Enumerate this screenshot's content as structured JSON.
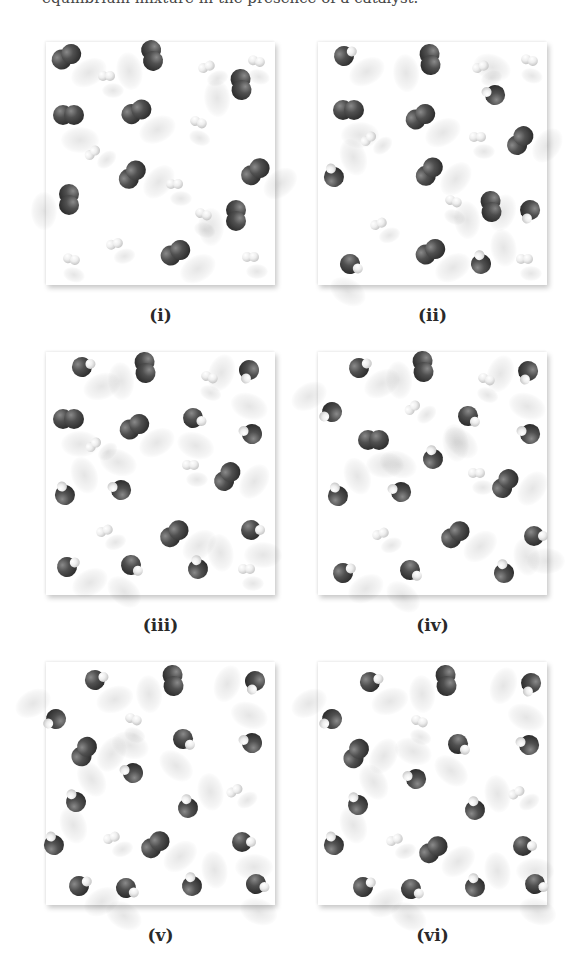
{
  "caption_top": "equilibrium mixture in the presence of a catalyst.",
  "legend": {
    "I": {
      "name": "iodine atom",
      "color": "#3a3a3a"
    },
    "H": {
      "name": "hydrogen atom",
      "color": "#e8e8e8"
    }
  },
  "panels": [
    {
      "label": "(i)",
      "counts": {
        "I2": 10,
        "H2": 10,
        "HI": 0
      },
      "molecules": [
        {
          "t": "I2",
          "x": 20,
          "y": 15,
          "a": -30
        },
        {
          "t": "I2",
          "x": 106,
          "y": 13,
          "a": 80
        },
        {
          "t": "I2",
          "x": 195,
          "y": 42,
          "a": 85
        },
        {
          "t": "I2",
          "x": 22,
          "y": 73,
          "a": 0
        },
        {
          "t": "I2",
          "x": 90,
          "y": 70,
          "a": -25
        },
        {
          "t": "I2",
          "x": 86,
          "y": 133,
          "a": -50
        },
        {
          "t": "I2",
          "x": 23,
          "y": 157,
          "a": 90
        },
        {
          "t": "I2",
          "x": 209,
          "y": 130,
          "a": -40
        },
        {
          "t": "I2",
          "x": 190,
          "y": 173,
          "a": 90
        },
        {
          "t": "I2",
          "x": 129,
          "y": 211,
          "a": -30
        },
        {
          "t": "H2",
          "x": 60,
          "y": 34,
          "a": 0
        },
        {
          "t": "H2",
          "x": 160,
          "y": 25,
          "a": -20
        },
        {
          "t": "H2",
          "x": 210,
          "y": 19,
          "a": 15
        },
        {
          "t": "H2",
          "x": 152,
          "y": 80,
          "a": 20
        },
        {
          "t": "H2",
          "x": 46,
          "y": 111,
          "a": -40
        },
        {
          "t": "H2",
          "x": 128,
          "y": 142,
          "a": 0
        },
        {
          "t": "H2",
          "x": 157,
          "y": 172,
          "a": 20
        },
        {
          "t": "H2",
          "x": 68,
          "y": 202,
          "a": -15
        },
        {
          "t": "H2",
          "x": 25,
          "y": 217,
          "a": 15
        },
        {
          "t": "H2",
          "x": 204,
          "y": 215,
          "a": 0
        }
      ]
    },
    {
      "label": "(ii)",
      "counts": {
        "I2": 7,
        "H2": 7,
        "HI": 6
      },
      "molecules": [
        {
          "t": "I2",
          "x": 112,
          "y": 17,
          "a": 85
        },
        {
          "t": "I2",
          "x": 30,
          "y": 68,
          "a": 0
        },
        {
          "t": "I2",
          "x": 102,
          "y": 75,
          "a": -30
        },
        {
          "t": "I2",
          "x": 202,
          "y": 99,
          "a": -55
        },
        {
          "t": "I2",
          "x": 111,
          "y": 130,
          "a": -50
        },
        {
          "t": "I2",
          "x": 173,
          "y": 164,
          "a": 85
        },
        {
          "t": "I2",
          "x": 112,
          "y": 210,
          "a": -30
        },
        {
          "t": "HI",
          "x": 26,
          "y": 14,
          "a": -30
        },
        {
          "t": "HI",
          "x": 177,
          "y": 53,
          "a": 200
        },
        {
          "t": "HI",
          "x": 16,
          "y": 135,
          "a": -110
        },
        {
          "t": "HI",
          "x": 212,
          "y": 168,
          "a": 110
        },
        {
          "t": "HI",
          "x": 32,
          "y": 222,
          "a": 30
        },
        {
          "t": "HI",
          "x": 163,
          "y": 222,
          "a": -100
        },
        {
          "t": "H2",
          "x": 162,
          "y": 25,
          "a": -20
        },
        {
          "t": "H2",
          "x": 211,
          "y": 18,
          "a": 15
        },
        {
          "t": "H2",
          "x": 50,
          "y": 97,
          "a": -40
        },
        {
          "t": "H2",
          "x": 159,
          "y": 95,
          "a": 0
        },
        {
          "t": "H2",
          "x": 135,
          "y": 159,
          "a": 20
        },
        {
          "t": "H2",
          "x": 60,
          "y": 182,
          "a": -20
        },
        {
          "t": "H2",
          "x": 206,
          "y": 217,
          "a": 0
        }
      ]
    },
    {
      "label": "(iii)",
      "counts": {
        "I2": 5,
        "H2": 5,
        "HI": 10
      },
      "molecules": [
        {
          "t": "I2",
          "x": 99,
          "y": 15,
          "a": 85
        },
        {
          "t": "I2",
          "x": 22,
          "y": 67,
          "a": 0
        },
        {
          "t": "I2",
          "x": 88,
          "y": 75,
          "a": -30
        },
        {
          "t": "I2",
          "x": 181,
          "y": 125,
          "a": -55
        },
        {
          "t": "I2",
          "x": 128,
          "y": 182,
          "a": -40
        },
        {
          "t": "HI",
          "x": 36,
          "y": 15,
          "a": -20
        },
        {
          "t": "HI",
          "x": 203,
          "y": 18,
          "a": 110
        },
        {
          "t": "HI",
          "x": 147,
          "y": 66,
          "a": 20
        },
        {
          "t": "HI",
          "x": 206,
          "y": 82,
          "a": 200
        },
        {
          "t": "HI",
          "x": 19,
          "y": 143,
          "a": -110
        },
        {
          "t": "HI",
          "x": 75,
          "y": 138,
          "a": 200
        },
        {
          "t": "HI",
          "x": 205,
          "y": 178,
          "a": 0
        },
        {
          "t": "HI",
          "x": 21,
          "y": 215,
          "a": -30
        },
        {
          "t": "HI",
          "x": 85,
          "y": 213,
          "a": 40
        },
        {
          "t": "HI",
          "x": 152,
          "y": 217,
          "a": -100
        },
        {
          "t": "H2",
          "x": 163,
          "y": 25,
          "a": 20
        },
        {
          "t": "H2",
          "x": 47,
          "y": 93,
          "a": -40
        },
        {
          "t": "H2",
          "x": 144,
          "y": 113,
          "a": 0
        },
        {
          "t": "H2",
          "x": 58,
          "y": 179,
          "a": -20
        },
        {
          "t": "H2",
          "x": 200,
          "y": 217,
          "a": 0
        }
      ]
    },
    {
      "label": "(iv)",
      "counts": {
        "I2": 4,
        "H2": 4,
        "HI": 12
      },
      "molecules": [
        {
          "t": "I2",
          "x": 105,
          "y": 14,
          "a": 85
        },
        {
          "t": "I2",
          "x": 55,
          "y": 88,
          "a": 0
        },
        {
          "t": "I2",
          "x": 187,
          "y": 132,
          "a": -55
        },
        {
          "t": "I2",
          "x": 137,
          "y": 183,
          "a": -40
        },
        {
          "t": "HI",
          "x": 41,
          "y": 16,
          "a": -30
        },
        {
          "t": "HI",
          "x": 210,
          "y": 19,
          "a": 110
        },
        {
          "t": "HI",
          "x": 14,
          "y": 60,
          "a": 150
        },
        {
          "t": "HI",
          "x": 150,
          "y": 64,
          "a": 40
        },
        {
          "t": "HI",
          "x": 212,
          "y": 82,
          "a": 200
        },
        {
          "t": "HI",
          "x": 115,
          "y": 107,
          "a": -100
        },
        {
          "t": "HI",
          "x": 20,
          "y": 144,
          "a": -110
        },
        {
          "t": "HI",
          "x": 83,
          "y": 140,
          "a": 200
        },
        {
          "t": "HI",
          "x": 216,
          "y": 184,
          "a": 0
        },
        {
          "t": "HI",
          "x": 25,
          "y": 221,
          "a": -30
        },
        {
          "t": "HI",
          "x": 92,
          "y": 218,
          "a": 40
        },
        {
          "t": "HI",
          "x": 186,
          "y": 221,
          "a": -100
        },
        {
          "t": "H2",
          "x": 168,
          "y": 27,
          "a": 20
        },
        {
          "t": "H2",
          "x": 94,
          "y": 56,
          "a": -40
        },
        {
          "t": "H2",
          "x": 158,
          "y": 121,
          "a": 0
        },
        {
          "t": "H2",
          "x": 62,
          "y": 182,
          "a": -20
        }
      ]
    },
    {
      "label": "(v)",
      "counts": {
        "I2": 3,
        "H2": 3,
        "HI": 14
      },
      "molecules": [
        {
          "t": "I2",
          "x": 127,
          "y": 18,
          "a": 85
        },
        {
          "t": "I2",
          "x": 38,
          "y": 90,
          "a": -60
        },
        {
          "t": "I2",
          "x": 109,
          "y": 183,
          "a": -40
        },
        {
          "t": "HI",
          "x": 49,
          "y": 18,
          "a": -20
        },
        {
          "t": "HI",
          "x": 209,
          "y": 19,
          "a": 110
        },
        {
          "t": "HI",
          "x": 10,
          "y": 57,
          "a": 150
        },
        {
          "t": "HI",
          "x": 137,
          "y": 77,
          "a": 40
        },
        {
          "t": "HI",
          "x": 206,
          "y": 81,
          "a": 200
        },
        {
          "t": "HI",
          "x": 87,
          "y": 111,
          "a": 200
        },
        {
          "t": "HI",
          "x": 30,
          "y": 140,
          "a": -120
        },
        {
          "t": "HI",
          "x": 142,
          "y": 146,
          "a": -100
        },
        {
          "t": "HI",
          "x": 8,
          "y": 183,
          "a": -110
        },
        {
          "t": "HI",
          "x": 196,
          "y": 180,
          "a": 0
        },
        {
          "t": "HI",
          "x": 33,
          "y": 224,
          "a": -30
        },
        {
          "t": "HI",
          "x": 80,
          "y": 226,
          "a": 30
        },
        {
          "t": "HI",
          "x": 146,
          "y": 224,
          "a": -100
        },
        {
          "t": "HI",
          "x": 210,
          "y": 222,
          "a": 20
        },
        {
          "t": "H2",
          "x": 87,
          "y": 57,
          "a": 20
        },
        {
          "t": "H2",
          "x": 188,
          "y": 129,
          "a": -30
        },
        {
          "t": "H2",
          "x": 65,
          "y": 176,
          "a": -20
        }
      ]
    },
    {
      "label": "(vi)",
      "counts": {
        "I2": 3,
        "H2": 3,
        "HI": 14
      },
      "molecules": [
        {
          "t": "I2",
          "x": 128,
          "y": 18,
          "a": 85
        },
        {
          "t": "I2",
          "x": 38,
          "y": 92,
          "a": -60
        },
        {
          "t": "I2",
          "x": 115,
          "y": 188,
          "a": -40
        },
        {
          "t": "HI",
          "x": 52,
          "y": 20,
          "a": -20
        },
        {
          "t": "HI",
          "x": 213,
          "y": 21,
          "a": 110
        },
        {
          "t": "HI",
          "x": 14,
          "y": 57,
          "a": 150
        },
        {
          "t": "HI",
          "x": 140,
          "y": 82,
          "a": 40
        },
        {
          "t": "HI",
          "x": 211,
          "y": 83,
          "a": 200
        },
        {
          "t": "HI",
          "x": 98,
          "y": 117,
          "a": 200
        },
        {
          "t": "HI",
          "x": 40,
          "y": 143,
          "a": -120
        },
        {
          "t": "HI",
          "x": 157,
          "y": 148,
          "a": -100
        },
        {
          "t": "HI",
          "x": 16,
          "y": 183,
          "a": -110
        },
        {
          "t": "HI",
          "x": 205,
          "y": 184,
          "a": 0
        },
        {
          "t": "HI",
          "x": 45,
          "y": 225,
          "a": -30
        },
        {
          "t": "HI",
          "x": 93,
          "y": 227,
          "a": 30
        },
        {
          "t": "HI",
          "x": 157,
          "y": 225,
          "a": -100
        },
        {
          "t": "HI",
          "x": 217,
          "y": 222,
          "a": 20
        },
        {
          "t": "H2",
          "x": 101,
          "y": 59,
          "a": 20
        },
        {
          "t": "H2",
          "x": 198,
          "y": 131,
          "a": -30
        },
        {
          "t": "H2",
          "x": 76,
          "y": 178,
          "a": -20
        }
      ]
    }
  ],
  "layout": {
    "panel_positions": [
      [
        46,
        42
      ],
      [
        318,
        42
      ],
      [
        46,
        352
      ],
      [
        318,
        352
      ],
      [
        46,
        662
      ],
      [
        318,
        662
      ]
    ],
    "label_offset_y": 263
  }
}
